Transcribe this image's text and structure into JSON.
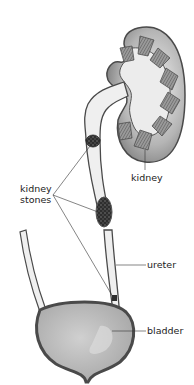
{
  "diagram": {
    "labels": {
      "kidney": "kidney",
      "kidney_stones_line1": "kidney",
      "kidney_stones_line2": "stones",
      "ureter": "ureter",
      "bladder": "bladder"
    },
    "stone_locations": [
      "renal pelvis / upper ureter",
      "mid ureter",
      "ureter-bladder junction"
    ],
    "colors": {
      "outline": "#4a4a4a",
      "kidney_cortex": "#8a8a8a",
      "kidney_inner": "#e8e8e8",
      "pyramid": "#7a7a7a",
      "bladder_wall": "#555555",
      "bladder_fill": "#bdbdbd",
      "stone": "#3a3a3a",
      "leader_line": "#333333"
    }
  }
}
